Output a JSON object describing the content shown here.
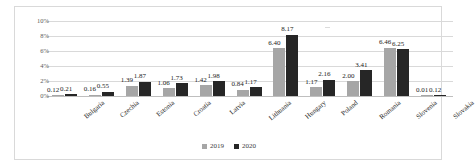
{
  "chart_data": {
    "type": "bar",
    "title": "",
    "subtitle": "",
    "xlabel": "",
    "ylabel": "",
    "ylim": [
      0,
      10
    ],
    "y_tick_labels": [
      "10%",
      "8%",
      "6%",
      "4%",
      "2%",
      "0%"
    ],
    "y_tick_values": [
      10,
      8,
      6,
      4,
      2,
      0
    ],
    "grid": true,
    "legend_position": "bottom-center",
    "categories": [
      "Bulgaria",
      "Czechia",
      "Estonia",
      "Croatia",
      "Latvia",
      "Lithuania",
      "Hungary",
      "Poland",
      "Romania",
      "Slovenia",
      "Slovakia"
    ],
    "series": [
      {
        "name": "2019",
        "color": "#a6a6a6",
        "values": [
          0.12,
          0.16,
          1.39,
          1.06,
          1.42,
          0.84,
          6.4,
          1.17,
          2.0,
          6.46,
          0.01
        ],
        "labels": [
          "0.12",
          "0.16",
          "1.39",
          "1.06",
          "1.42",
          "0.84",
          "6.40",
          "1.17",
          "2.00",
          "6.46",
          "0.01"
        ]
      },
      {
        "name": "2020",
        "color": "#262626",
        "values": [
          0.21,
          0.55,
          1.87,
          1.73,
          1.98,
          1.17,
          8.17,
          2.16,
          3.41,
          6.25,
          0.12
        ],
        "labels": [
          "0.21",
          "0.55",
          "1.87",
          "1.73",
          "1.98",
          "1.17",
          "8.17",
          "2.16",
          "3.41",
          "6.25",
          "0.12"
        ]
      }
    ]
  },
  "legend": {
    "entries": [
      {
        "label": "2019",
        "color": "#a6a6a6"
      },
      {
        "label": "2020",
        "color": "#262626"
      }
    ]
  },
  "colors": {
    "series_2019": "#a6a6a6",
    "series_2020": "#262626",
    "gridline": "#d9d9d9",
    "frame": "#d9d9d9",
    "text": "#262626",
    "axis_text": "#595959",
    "background": "#ffffff"
  }
}
